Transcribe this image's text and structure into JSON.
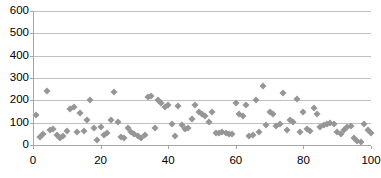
{
  "chart_data": {
    "type": "scatter",
    "title": "",
    "xlabel": "",
    "ylabel": "",
    "xlim": [
      0,
      100
    ],
    "ylim": [
      0,
      600
    ],
    "grid": true,
    "legend": "none",
    "marker": {
      "shape": "diamond",
      "color": "#969696",
      "size": 5
    },
    "yticks": [
      0,
      100,
      200,
      300,
      400,
      500,
      600
    ],
    "xticks": [
      0,
      20,
      40,
      60,
      80,
      100
    ],
    "ytick_labels": [
      "0",
      "100",
      "200",
      "300",
      "400",
      "500",
      "600"
    ],
    "xtick_labels": [
      "0",
      "20",
      "40",
      "60",
      "80",
      "100"
    ],
    "series": [
      {
        "name": "series-1",
        "points": [
          [
            1,
            133
          ],
          [
            2,
            37
          ],
          [
            3,
            50
          ],
          [
            4,
            243
          ],
          [
            5,
            67
          ],
          [
            6,
            72
          ],
          [
            7,
            46
          ],
          [
            8,
            33
          ],
          [
            9,
            40
          ],
          [
            10,
            62
          ],
          [
            11,
            163
          ],
          [
            12,
            168
          ],
          [
            13,
            60
          ],
          [
            14,
            145
          ],
          [
            15,
            63
          ],
          [
            16,
            110
          ],
          [
            17,
            203
          ],
          [
            18,
            75
          ],
          [
            19,
            22
          ],
          [
            20,
            80
          ],
          [
            21,
            47
          ],
          [
            22,
            53
          ],
          [
            23,
            112
          ],
          [
            24,
            238
          ],
          [
            25,
            105
          ],
          [
            26,
            36
          ],
          [
            27,
            33
          ],
          [
            28,
            78
          ],
          [
            29,
            60
          ],
          [
            30,
            50
          ],
          [
            31,
            40
          ],
          [
            32,
            30
          ],
          [
            33,
            45
          ],
          [
            34,
            213
          ],
          [
            35,
            218
          ],
          [
            36,
            78
          ],
          [
            37,
            200
          ],
          [
            38,
            190
          ],
          [
            39,
            172
          ],
          [
            40,
            178
          ],
          [
            41,
            95
          ],
          [
            42,
            40
          ],
          [
            43,
            173
          ],
          [
            44,
            88
          ],
          [
            45,
            73
          ],
          [
            46,
            76
          ],
          [
            47,
            118
          ],
          [
            48,
            178
          ],
          [
            49,
            150
          ],
          [
            50,
            140
          ],
          [
            51,
            128
          ],
          [
            52,
            102
          ],
          [
            53,
            150
          ],
          [
            54,
            55
          ],
          [
            55,
            52
          ],
          [
            56,
            58
          ],
          [
            57,
            55
          ],
          [
            58,
            50
          ],
          [
            59,
            50
          ],
          [
            60,
            188
          ],
          [
            61,
            140
          ],
          [
            62,
            132
          ],
          [
            63,
            180
          ],
          [
            64,
            40
          ],
          [
            65,
            45
          ],
          [
            66,
            200
          ],
          [
            67,
            60
          ],
          [
            68,
            265
          ],
          [
            69,
            90
          ],
          [
            70,
            150
          ],
          [
            71,
            138
          ],
          [
            72,
            83
          ],
          [
            73,
            92
          ],
          [
            74,
            233
          ],
          [
            75,
            67
          ],
          [
            76,
            110
          ],
          [
            77,
            105
          ],
          [
            78,
            207
          ],
          [
            79,
            58
          ],
          [
            80,
            146
          ],
          [
            81,
            70
          ],
          [
            82,
            63
          ],
          [
            83,
            165
          ],
          [
            84,
            140
          ],
          [
            85,
            80
          ],
          [
            86,
            88
          ],
          [
            87,
            95
          ],
          [
            88,
            97
          ],
          [
            89,
            93
          ],
          [
            90,
            58
          ],
          [
            91,
            50
          ],
          [
            92,
            65
          ],
          [
            93,
            80
          ],
          [
            94,
            85
          ],
          [
            95,
            30
          ],
          [
            96,
            20
          ],
          [
            97,
            15
          ],
          [
            98,
            95
          ],
          [
            99,
            65
          ],
          [
            100,
            52
          ]
        ]
      }
    ]
  }
}
